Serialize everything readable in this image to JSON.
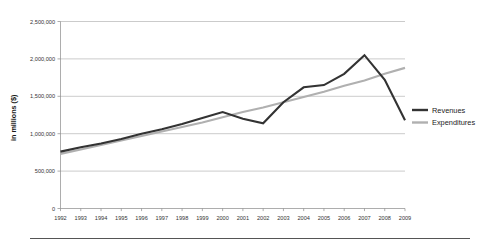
{
  "chart_data": {
    "type": "line",
    "title": "",
    "xlabel": "",
    "ylabel": "in millions ($)",
    "grid": true,
    "legend_position": "right",
    "categories": [
      "1992",
      "1993",
      "1994",
      "1995",
      "1996",
      "1997",
      "1998",
      "1999",
      "2000",
      "2001",
      "2002",
      "2003",
      "2004",
      "2005",
      "2006",
      "2007",
      "2008",
      "2009"
    ],
    "x": [
      1992,
      1993,
      1994,
      1995,
      1996,
      1997,
      1998,
      1999,
      2000,
      2001,
      2002,
      2003,
      2004,
      2005,
      2006,
      2007,
      2008,
      2009
    ],
    "xlim": [
      1992,
      2009
    ],
    "ylim": [
      0,
      2500000
    ],
    "ytick_labels": [
      "2,500,000",
      "2,000,000",
      "1,500,000",
      "1,000,000",
      "500,000",
      "0"
    ],
    "ytick_values": [
      2500000,
      2000000,
      1500000,
      1000000,
      500000,
      0
    ],
    "series": [
      {
        "name": "Revenues",
        "color": "#333333",
        "width": 2.1,
        "values": [
          760000,
          820000,
          870000,
          930000,
          1000000,
          1060000,
          1130000,
          1210000,
          1290000,
          1200000,
          1140000,
          1420000,
          1620000,
          1650000,
          1800000,
          2050000,
          1720000,
          1180000
        ]
      },
      {
        "name": "Expenditures",
        "color": "#b0b0b0",
        "width": 2.1,
        "values": [
          730000,
          790000,
          850000,
          910000,
          970000,
          1030000,
          1090000,
          1150000,
          1220000,
          1290000,
          1350000,
          1420000,
          1490000,
          1560000,
          1640000,
          1710000,
          1800000,
          1880000
        ]
      }
    ]
  },
  "legend": {
    "items": [
      {
        "label": "Revenues",
        "color": "#333333"
      },
      {
        "label": "Expenditures",
        "color": "#b0b0b0"
      }
    ]
  },
  "axis": {
    "y_title": "in millions ($)"
  }
}
